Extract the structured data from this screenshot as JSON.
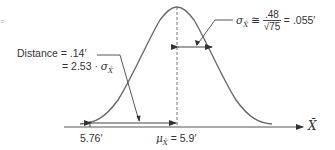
{
  "diagram": {
    "type": "normal-distribution-sampling",
    "distance_label": {
      "line1_prefix": "Distance",
      "line1_eq": "= .14′",
      "line2_eq": "= 2.53 ·",
      "sigma_symbol": "σ",
      "sigma_sub": "X̄"
    },
    "sigma_formula": {
      "symbol": "σ",
      "sub": "X̄",
      "approx": "≅",
      "numerator": ".48",
      "denominator_radical": "√75",
      "result": "= .055′"
    },
    "axis": {
      "label": "X̄",
      "tick_left_label": "5.76′",
      "mean_symbol": "μ",
      "mean_sub": "X̄",
      "mean_value": "= 5.9′"
    },
    "stray_mark": "=",
    "colors": {
      "curve": "#666666",
      "lines": "#444444",
      "text": "#333333",
      "background": "#ffffff"
    }
  }
}
